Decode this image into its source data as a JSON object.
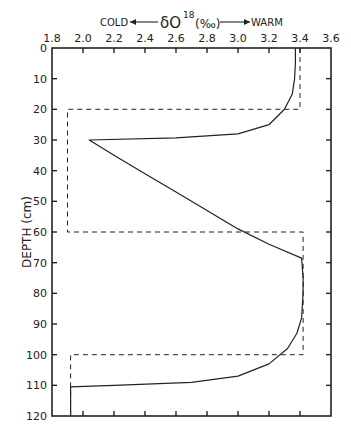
{
  "chart_data": {
    "type": "line",
    "title_parts": {
      "left": "COLD",
      "center": "δO",
      "sup": "18",
      "unit": "(‰)",
      "right": "WARM"
    },
    "xlabel": "δO18 (‰)",
    "ylabel": "DEPTH (cm)",
    "x_axis_position": "top",
    "y_inverted": true,
    "xlim": [
      1.8,
      3.6
    ],
    "ylim": [
      0,
      120
    ],
    "xticks": [
      "1.8",
      "2.0",
      "2.2",
      "2.4",
      "2.6",
      "2.8",
      "3.0",
      "3.2",
      "3.4",
      "3.6"
    ],
    "yticks": [
      "0",
      "10",
      "20",
      "30",
      "40",
      "50",
      "60",
      "70",
      "80",
      "90",
      "100",
      "110",
      "120"
    ],
    "grid": false,
    "series": [
      {
        "name": "δO18 profile (solid)",
        "style": "solid",
        "points": [
          [
            3.37,
            0
          ],
          [
            3.37,
            5
          ],
          [
            3.365,
            10
          ],
          [
            3.35,
            15
          ],
          [
            3.3,
            20
          ],
          [
            3.2,
            25
          ],
          [
            3.0,
            28
          ],
          [
            2.6,
            29.3
          ],
          [
            2.04,
            30
          ],
          [
            2.2,
            35
          ],
          [
            2.4,
            41
          ],
          [
            2.6,
            47
          ],
          [
            2.8,
            53
          ],
          [
            3.0,
            59
          ],
          [
            3.2,
            64
          ],
          [
            3.41,
            68.5
          ],
          [
            3.42,
            75
          ],
          [
            3.42,
            80
          ],
          [
            3.41,
            88
          ],
          [
            3.38,
            93
          ],
          [
            3.32,
            98
          ],
          [
            3.2,
            103
          ],
          [
            3.0,
            107
          ],
          [
            2.7,
            109
          ],
          [
            2.2,
            110
          ],
          [
            1.92,
            110.5
          ],
          [
            1.92,
            120
          ]
        ]
      },
      {
        "name": "stepped approximation (dashed)",
        "style": "dashed",
        "points": [
          [
            3.4,
            0
          ],
          [
            3.4,
            20
          ],
          [
            1.9,
            20
          ],
          [
            1.9,
            60
          ],
          [
            3.42,
            60
          ],
          [
            3.42,
            100
          ],
          [
            1.92,
            100
          ],
          [
            1.92,
            120
          ]
        ]
      }
    ]
  }
}
